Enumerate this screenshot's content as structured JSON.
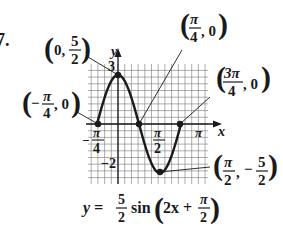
{
  "problem_number": "7.",
  "chart_data": {
    "type": "line",
    "title": "",
    "equation": "y = (5/2) sin(2x + π/2)",
    "equation_parts": {
      "lhs": "y =",
      "coef_num": "5",
      "coef_den": "2",
      "func": "sin",
      "arg_pre": "2x +",
      "arg_num": "π",
      "arg_den": "2"
    },
    "xlabel": "x",
    "ylabel": "y",
    "x_ticks": [
      {
        "value": -0.7854,
        "label": "−π/4"
      },
      {
        "value": 1.5708,
        "label": "π/2"
      },
      {
        "value": 3.1416,
        "label": "π"
      }
    ],
    "y_ticks": [
      {
        "value": 3,
        "label": "3"
      },
      {
        "value": -2,
        "label": "−2"
      }
    ],
    "xlim": [
      -1.18,
      3.53
    ],
    "ylim": [
      -3.0,
      3.0
    ],
    "grid": true,
    "key_points": [
      {
        "x": -0.7854,
        "y": 0,
        "label": "(−π/4, 0)"
      },
      {
        "x": 0,
        "y": 2.5,
        "label": "(0, 5/2)"
      },
      {
        "x": 0.7854,
        "y": 0,
        "label": "(π/4, 0)"
      },
      {
        "x": 1.5708,
        "y": -2.5,
        "label": "(π/2, −5/2)"
      },
      {
        "x": 2.3562,
        "y": 0,
        "label": "(3π/4, 0)"
      }
    ],
    "series": [
      {
        "name": "y = (5/2) sin(2x + π/2)",
        "amplitude": 2.5,
        "period": 3.1416,
        "phase_shift": -0.7854,
        "x_domain": [
          -0.7854,
          2.3562
        ]
      }
    ]
  },
  "annotations": {
    "max": {
      "a": "0,",
      "num": "5",
      "den": "2"
    },
    "zero_left": {
      "sign": "−",
      "num": "π",
      "den": "4",
      "b": ", 0"
    },
    "zero_mid": {
      "num": "π",
      "den": "4",
      "b": ", 0"
    },
    "zero_right": {
      "num": "3π",
      "den": "4",
      "b": ", 0"
    },
    "min": {
      "num": "π",
      "den": "2",
      "sep": ",",
      "sign": "−",
      "num2": "5",
      "den2": "2"
    }
  },
  "axis_labels": {
    "x": "x",
    "y": "y",
    "xt_pi": "π",
    "xt_pi2_num": "π",
    "xt_pi2_den": "2",
    "xt_neg_pi4_sign": "−",
    "xt_neg_pi4_num": "π",
    "xt_neg_pi4_den": "4",
    "yt_3": "3",
    "yt_neg2": "−2"
  }
}
